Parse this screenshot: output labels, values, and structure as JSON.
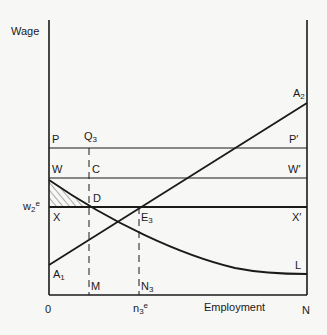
{
  "diagram": {
    "type": "labour-market wage-employment diagram",
    "y_axis_label": "Wage",
    "x_axis_label": "Employment",
    "origin_label": "0",
    "right_axis_label": "N",
    "lines": {
      "P_left": "P",
      "P_right": "P′",
      "W_left": "W",
      "W_right": "W′",
      "X_left": "X",
      "X_right": "X′",
      "w2e_base": "w",
      "w2e_sub": "2",
      "w2e_sup": "e",
      "A1_base": "A",
      "A1_sub": "1",
      "A2_base": "A",
      "A2_sub": "2",
      "L": "L"
    },
    "points": {
      "Q3_base": "Q",
      "Q3_sub": "3",
      "C": "C",
      "D": "D",
      "E3_base": "E",
      "E3_sub": "3",
      "M": "M",
      "N3_base": "N",
      "N3_sub": "3",
      "n3e_base": "n",
      "n3e_sub": "3",
      "n3e_sup": "e"
    },
    "colors": {
      "ink": "#1a1a1a",
      "background": "#f7f7f5"
    }
  }
}
